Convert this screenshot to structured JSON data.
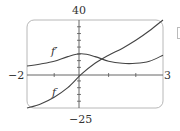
{
  "chart_data": {
    "type": "line",
    "title": "",
    "xlabel": "",
    "ylabel": "",
    "xlim": [
      -2,
      3
    ],
    "ylim": [
      -25,
      40
    ],
    "grid": false,
    "legend": "inline labels",
    "tick_labels": {
      "x_left": "−2",
      "x_right": "3",
      "y_top": "40",
      "y_bottom": "−25"
    },
    "series": [
      {
        "name": "f′",
        "x": [
          -2,
          -1.5,
          -1,
          -0.5,
          0,
          0.5,
          1,
          1.5,
          2,
          2.5,
          3
        ],
        "y": [
          6,
          7.5,
          9.5,
          13,
          15,
          13,
          9.5,
          8,
          8,
          9.5,
          14
        ]
      },
      {
        "name": "f",
        "x": [
          -2,
          -1.5,
          -1,
          -0.5,
          0,
          0.5,
          1,
          1.5,
          2,
          2.5,
          3
        ],
        "y": [
          -25,
          -22,
          -17,
          -10,
          0,
          8,
          14,
          19,
          25,
          32,
          40
        ]
      }
    ]
  },
  "labels": {
    "y_top": "40",
    "y_bottom": "−25",
    "x_left": "−2",
    "x_right": "3",
    "fprime": "f′",
    "f": "f"
  },
  "colors": {
    "frame": "#b8b8b8",
    "axis": "#555555",
    "curve": "#444444"
  }
}
